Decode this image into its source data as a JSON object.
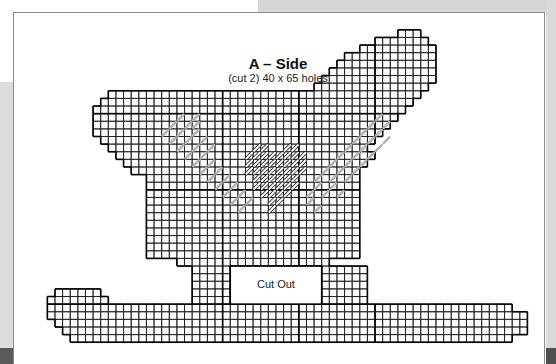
{
  "pattern": {
    "title": "A – Side",
    "subtitle": "(cut 2) 40 x 65 holes",
    "cutout_label": "Cut Out",
    "colors": {
      "grid_line": "#1a1a1a",
      "bold_line": "#000000",
      "stitch_gray": "#b4b4b4",
      "heart_stitch_fill": "#ffffff",
      "heart_stitch_outline": "#222222",
      "frame": "#8a8a8a"
    }
  }
}
